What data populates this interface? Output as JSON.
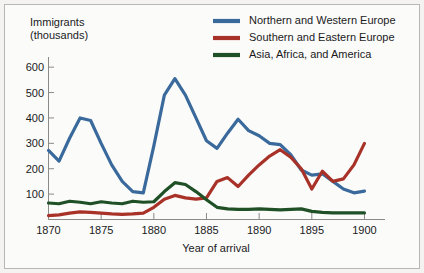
{
  "figure": {
    "background_color": "#fbfbfa",
    "border_color": "#b9b7b4"
  },
  "axis": {
    "y_title_line1": "Immigrants",
    "y_title_line2": "(thousands)",
    "x_title": "Year of arrival",
    "y_ticks": [
      "100",
      "200",
      "300",
      "400",
      "500",
      "600"
    ],
    "x_ticks": [
      "1870",
      "1875",
      "1880",
      "1885",
      "1890",
      "1895",
      "1900"
    ]
  },
  "legend": {
    "position": "top-right",
    "entries": [
      {
        "label": "Northern and Western Europe",
        "color": "#3a6a9c"
      },
      {
        "label": "Southern and Eastern Europe",
        "color": "#a83228"
      },
      {
        "label": "Asia, Africa, and America",
        "color": "#1f5026"
      }
    ]
  },
  "chart_data": {
    "type": "line",
    "title": "",
    "subtitle": "",
    "xlabel": "Year of arrival",
    "ylabel": "Immigrants (thousands)",
    "xlim": [
      1870,
      1901
    ],
    "ylim": [
      0,
      640
    ],
    "y_ticks": [
      100,
      200,
      300,
      400,
      500,
      600
    ],
    "x_ticks": [
      1870,
      1875,
      1880,
      1885,
      1890,
      1895,
      1900
    ],
    "grid": false,
    "legend_position": "top-right",
    "x": [
      1870,
      1871,
      1872,
      1873,
      1874,
      1875,
      1876,
      1877,
      1878,
      1879,
      1880,
      1881,
      1882,
      1883,
      1884,
      1885,
      1886,
      1887,
      1888,
      1889,
      1890,
      1891,
      1892,
      1893,
      1894,
      1895,
      1896,
      1897,
      1898,
      1899,
      1900
    ],
    "series": [
      {
        "name": "Northern and Western Europe",
        "color": "#3a6a9c",
        "values": [
          272,
          230,
          320,
          400,
          390,
          300,
          215,
          150,
          110,
          105,
          290,
          490,
          555,
          490,
          400,
          310,
          280,
          340,
          395,
          350,
          330,
          300,
          295,
          255,
          195,
          175,
          180,
          150,
          120,
          105,
          112
        ]
      },
      {
        "name": "Southern and Eastern Europe",
        "color": "#a83228",
        "values": [
          15,
          18,
          25,
          30,
          28,
          25,
          22,
          20,
          22,
          25,
          48,
          80,
          95,
          85,
          80,
          85,
          150,
          165,
          130,
          175,
          215,
          250,
          275,
          245,
          200,
          120,
          190,
          150,
          160,
          215,
          300
        ]
      },
      {
        "name": "Asia, Africa, and America",
        "color": "#1f5026",
        "values": [
          65,
          62,
          72,
          68,
          62,
          70,
          65,
          62,
          72,
          68,
          70,
          110,
          145,
          138,
          110,
          78,
          48,
          42,
          40,
          40,
          42,
          40,
          38,
          40,
          42,
          32,
          28,
          26,
          26,
          26,
          26
        ]
      }
    ]
  }
}
